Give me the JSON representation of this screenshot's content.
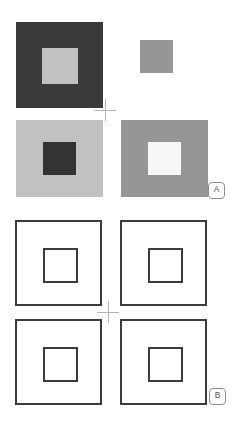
{
  "figure": {
    "background_color": "#ffffff",
    "width": 242,
    "height": 430,
    "panels": [
      {
        "id": "A",
        "label": "A",
        "kind": "filled-squares",
        "crosshair": {
          "cx": 105,
          "cy": 110,
          "size": 22,
          "color": "#b4b4b4"
        },
        "stimuli": [
          {
            "name": "top-left",
            "x": 16,
            "y": 22,
            "w": 87,
            "h": 86,
            "fill": "#3a3a3a",
            "inner": {
              "x": 26,
              "y": 26,
              "w": 36,
              "h": 36,
              "fill": "#c1c1c1"
            }
          },
          {
            "name": "top-right",
            "x": 140,
            "y": 40,
            "w": 33,
            "h": 33,
            "fill": "#969696",
            "inner": null
          },
          {
            "name": "bottom-left",
            "x": 16,
            "y": 120,
            "w": 87,
            "h": 77,
            "fill": "#c1c1c1",
            "inner": {
              "x": 27,
              "y": 22,
              "w": 33,
              "h": 33,
              "fill": "#333333"
            }
          },
          {
            "name": "bottom-right",
            "x": 121,
            "y": 120,
            "w": 87,
            "h": 77,
            "fill": "#969696",
            "inner": {
              "x": 27,
              "y": 22,
              "w": 33,
              "h": 33,
              "fill": "#f7f7f7"
            }
          }
        ]
      },
      {
        "id": "B",
        "label": "B",
        "kind": "outline-squares",
        "crosshair": {
          "cx": 108,
          "cy": 100,
          "size": 22,
          "color": "#b4b4b4"
        },
        "stroke_color": "#3c3c3c",
        "stimuli": [
          {
            "name": "top-left",
            "x": 15,
            "y": 8,
            "w": 87,
            "h": 86,
            "inner": {
              "x": 26,
              "y": 26,
              "w": 35,
              "h": 35
            }
          },
          {
            "name": "top-right",
            "x": 120,
            "y": 8,
            "w": 87,
            "h": 86,
            "inner": {
              "x": 26,
              "y": 26,
              "w": 35,
              "h": 35
            }
          },
          {
            "name": "bottom-left",
            "x": 15,
            "y": 107,
            "w": 87,
            "h": 86,
            "inner": {
              "x": 26,
              "y": 26,
              "w": 35,
              "h": 35
            }
          },
          {
            "name": "bottom-right",
            "x": 120,
            "y": 107,
            "w": 87,
            "h": 86,
            "inner": {
              "x": 26,
              "y": 26,
              "w": 35,
              "h": 35
            }
          }
        ]
      }
    ],
    "badges": [
      {
        "label": "A",
        "x": 208,
        "y": 182
      },
      {
        "label": "B",
        "x": 209,
        "y": 388
      }
    ]
  }
}
